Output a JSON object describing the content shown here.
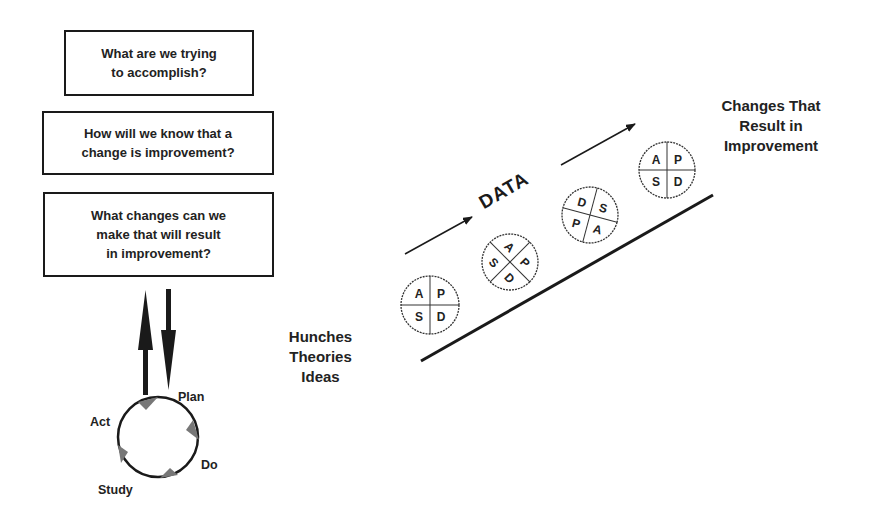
{
  "model_for_improvement": {
    "questions": [
      "What are we trying\nto accomplish?",
      "How will we know that a\nchange is improvement?",
      "What changes can we\nmake that will result\nin improvement?"
    ],
    "cycle": {
      "stages": [
        "Plan",
        "Do",
        "Study",
        "Act"
      ]
    }
  },
  "ramp": {
    "start_label": "Hunches\nTheories\nIdeas",
    "end_label": "Changes That\nResult in\nImprovement",
    "data_label": "DATA",
    "cycles": [
      {
        "quadrants": [
          "A",
          "P",
          "S",
          "D"
        ]
      },
      {
        "quadrants": [
          "A",
          "P",
          "S",
          "D"
        ]
      },
      {
        "quadrants": [
          "D",
          "S",
          "P",
          "A"
        ]
      },
      {
        "quadrants": [
          "A",
          "P",
          "S",
          "D"
        ]
      }
    ]
  },
  "colors": {
    "ink": "#1a1a1a",
    "cycle_arrowheads": "#777777",
    "background": "#ffffff"
  }
}
